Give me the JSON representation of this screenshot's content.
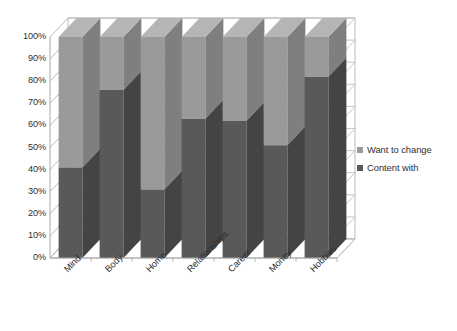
{
  "chart_data": {
    "type": "bar",
    "subtype": "stacked-100-percent-3d-column",
    "title": "",
    "xlabel": "",
    "ylabel": "",
    "categories": [
      "Mind",
      "Body",
      "Home",
      "Relationships",
      "Career",
      "Money",
      "Hobbies"
    ],
    "series": [
      {
        "name": "Content with",
        "color": "#595959",
        "values": [
          41,
          76,
          31,
          63,
          62,
          51,
          82
        ]
      },
      {
        "name": "Want to change",
        "color": "#9a9a9a",
        "values": [
          59,
          24,
          69,
          37,
          38,
          49,
          18
        ]
      }
    ],
    "ylim": [
      0,
      100
    ],
    "ytick_values": [
      0,
      10,
      20,
      30,
      40,
      50,
      60,
      70,
      80,
      90,
      100
    ],
    "ytick_labels": [
      "0%",
      "10%",
      "20%",
      "30%",
      "40%",
      "50%",
      "60%",
      "70%",
      "80%",
      "90%",
      "100%"
    ],
    "grid": true,
    "legend_position": "right",
    "legend": [
      "Want to change",
      "Content with"
    ],
    "stack_order_bottom_to_top": [
      "Content with",
      "Want to change"
    ]
  },
  "legend": {
    "items": [
      {
        "label": "Want to change",
        "marker": "legend-swatch-light"
      },
      {
        "label": "Content with",
        "marker": "legend-swatch-dark"
      }
    ]
  },
  "colors": {
    "series_light": "#9a9a9a",
    "series_light_side": "#7f7f7f",
    "series_light_top": "#b5b5b5",
    "series_dark": "#595959",
    "series_dark_side": "#444444",
    "gridline": "#b9b9b9",
    "axis": "#a8a8a8",
    "wall": "#ffffff",
    "text": "#2f2f2f",
    "background": "#ffffff"
  }
}
